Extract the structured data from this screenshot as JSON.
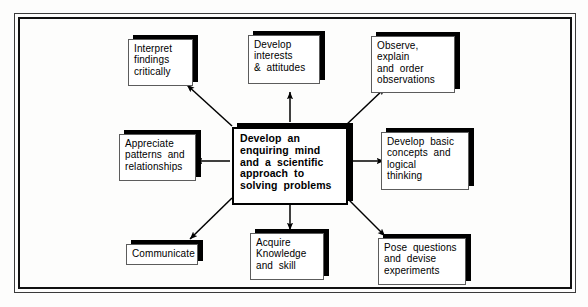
{
  "diagram": {
    "type": "concept-map",
    "title_text": "Develop an enquiring mind and a scientific approach to solving problems",
    "center": {
      "id": "center",
      "lines": [
        "Develop  an",
        "enquiring  mind",
        "and  a  scientific",
        "approach  to",
        "solving  problems"
      ]
    },
    "nodes": [
      {
        "id": "interpret-findings",
        "lines": [
          "Interpret",
          "findings",
          "critically"
        ]
      },
      {
        "id": "develop-interests",
        "lines": [
          "Develop",
          "interests",
          "&  attitudes"
        ]
      },
      {
        "id": "observe-explain",
        "lines": [
          "Observe,",
          "explain",
          "and  order",
          "observations"
        ]
      },
      {
        "id": "appreciate-patterns",
        "lines": [
          "Appreciate",
          "patterns  and",
          "relationships"
        ]
      },
      {
        "id": "develop-concepts",
        "lines": [
          "Develop  basic",
          "concepts  and",
          "logical",
          "thinking"
        ]
      },
      {
        "id": "communicate",
        "lines": [
          "Communicate"
        ]
      },
      {
        "id": "acquire-knowledge",
        "lines": [
          "Acquire",
          "Knowledge",
          "and  skill"
        ]
      },
      {
        "id": "pose-questions",
        "lines": [
          "Pose  questions",
          "and  devise",
          "experiments"
        ]
      }
    ],
    "links": [
      {
        "from": "center",
        "to": "interpret-findings",
        "arrow": "to"
      },
      {
        "from": "center",
        "to": "develop-interests",
        "arrow": "to"
      },
      {
        "from": "center",
        "to": "observe-explain",
        "arrow": "to"
      },
      {
        "from": "center",
        "to": "appreciate-patterns",
        "arrow": "to"
      },
      {
        "from": "center",
        "to": "develop-concepts",
        "arrow": "to"
      },
      {
        "from": "center",
        "to": "communicate",
        "arrow": "to"
      },
      {
        "from": "center",
        "to": "acquire-knowledge",
        "arrow": "to"
      },
      {
        "from": "center",
        "to": "pose-questions",
        "arrow": "to"
      }
    ],
    "colors": {
      "page_background": "#fdfdfc",
      "node_fill": "#ffffff",
      "node_border": "#5c5c5c",
      "center_border": "#000000",
      "shadow": "#000000",
      "connector": "#000000",
      "frame": "#111111"
    }
  }
}
